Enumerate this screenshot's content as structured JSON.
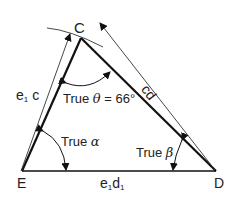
{
  "diagram": {
    "type": "triangle-true-angles",
    "vertices": {
      "C": {
        "label": "C"
      },
      "E": {
        "label": "E"
      },
      "D": {
        "label": "D"
      }
    },
    "edges": {
      "e1c": {
        "label_main": "e",
        "label_sub": "1",
        "label_rest": " c"
      },
      "cd": {
        "label": "cd"
      },
      "e1d1": {
        "label_main": "e",
        "label_sub1": "1",
        "label_mid": "d",
        "label_sub2": "1"
      }
    },
    "angles": {
      "theta": {
        "prefix": "True ",
        "symbol": "θ",
        "suffix": " = 66°"
      },
      "alpha": {
        "prefix": "True ",
        "symbol": "α"
      },
      "beta": {
        "prefix": "True ",
        "symbol": "β"
      }
    },
    "colors": {
      "line": "#111111",
      "thin": "#333333",
      "background": "#ffffff"
    }
  }
}
